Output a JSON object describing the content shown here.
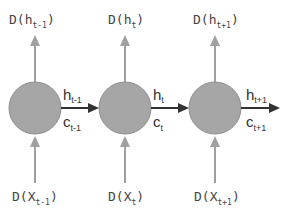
{
  "diagram": {
    "colors": {
      "cell_fill": "#a6a6a6",
      "cell_stroke": "#8f8f8f",
      "vertical_arrow": "#a0a0a0",
      "horizontal_arrow": "#333333",
      "text": "#444444"
    },
    "cells": [
      {
        "id": "cell-t-1",
        "output_label": {
          "base": "D(h",
          "sub": "t-1",
          "close": ")"
        },
        "input_label": {
          "base": "D(X",
          "sub": "t-1",
          "close": ")"
        },
        "h_label": {
          "base": "h",
          "sub": "t-1"
        },
        "c_label": {
          "base": "c",
          "sub": "t-1"
        }
      },
      {
        "id": "cell-t",
        "output_label": {
          "base": "D(h",
          "sub": "t",
          "close": ")"
        },
        "input_label": {
          "base": "D(X",
          "sub": "t",
          "close": ")"
        },
        "h_label": {
          "base": "h",
          "sub": "t"
        },
        "c_label": {
          "base": "c",
          "sub": "t"
        }
      },
      {
        "id": "cell-t+1",
        "output_label": {
          "base": "D(h",
          "sub": "t+1",
          "close": ")"
        },
        "input_label": {
          "base": "D(X",
          "sub": "t+1",
          "close": ")"
        },
        "h_label": {
          "base": "h",
          "sub": "t+1"
        },
        "c_label": {
          "base": "c",
          "sub": "t+1"
        }
      }
    ]
  }
}
